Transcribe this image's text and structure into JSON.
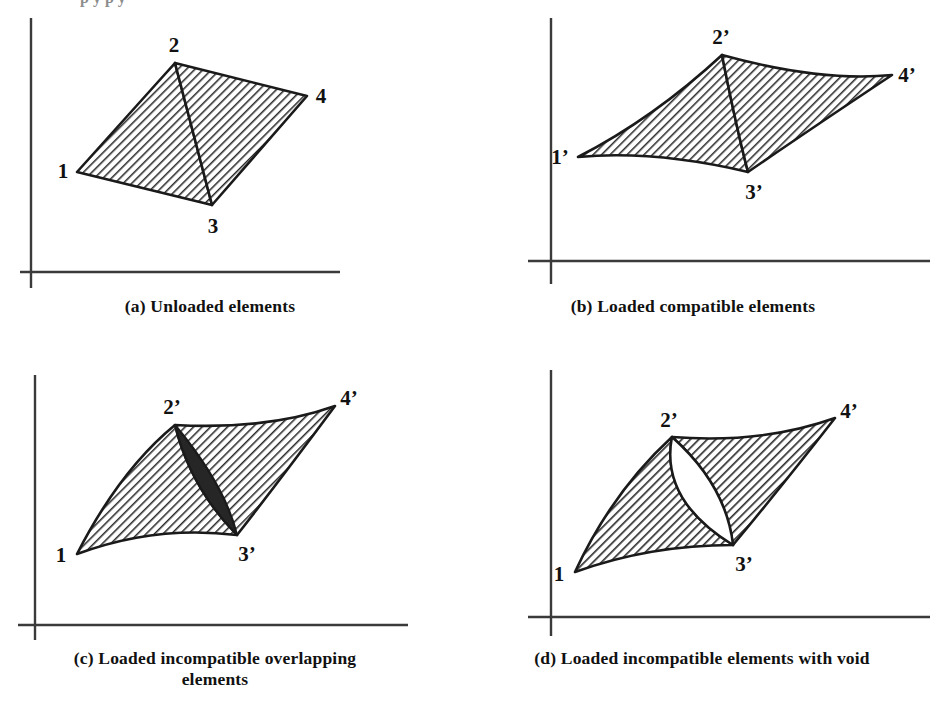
{
  "figure": {
    "background_color": "#ffffff",
    "ink_color": "#1a1a1a",
    "hatch_color": "#2b2b2b",
    "overlap_fill_color": "#262626",
    "void_fill_color": "#ffffff",
    "top_remnant_text": "p y p y"
  },
  "panels": [
    {
      "id": "a",
      "caption": "(a) Unloaded elements",
      "axes": {
        "origin_x": 31,
        "origin_y": 272,
        "x_axis_end": 340,
        "y_axis_top": 18
      },
      "node_labels": [
        "1",
        "2",
        "3",
        "4"
      ],
      "nodes": {
        "n1": {
          "label": "1",
          "x": 77,
          "y": 172,
          "label_x": 63,
          "label_y": 168
        },
        "n2": {
          "label": "2",
          "x": 175,
          "y": 63,
          "label_x": 172,
          "label_y": 44
        },
        "n3": {
          "label": "3",
          "x": 212,
          "y": 205,
          "label_x": 212,
          "label_y": 227
        },
        "n4": {
          "label": "4",
          "x": 307,
          "y": 96,
          "label_x": 319,
          "label_y": 96
        }
      },
      "edges_straight": true,
      "has_overlap": false,
      "has_void": false
    },
    {
      "id": "b",
      "caption": "(b) Loaded compatible elements",
      "axes": {
        "origin_x": 551,
        "origin_y": 261,
        "x_axis_end": 930,
        "y_axis_top": 18
      },
      "node_labels": [
        "1'",
        "2'",
        "3'",
        "4'"
      ],
      "nodes": {
        "n1": {
          "label": "1’",
          "x": 578,
          "y": 157,
          "label_x": 561,
          "label_y": 153
        },
        "n2": {
          "label": "2’",
          "x": 722,
          "y": 55,
          "label_x": 718,
          "label_y": 37
        },
        "n3": {
          "label": "3’",
          "x": 748,
          "y": 172,
          "label_x": 752,
          "label_y": 192
        },
        "n4": {
          "label": "4’",
          "x": 892,
          "y": 75,
          "label_x": 903,
          "label_y": 74
        }
      },
      "edges_straight": false,
      "has_overlap": false,
      "has_void": false
    },
    {
      "id": "c",
      "caption": "(c) Loaded incompatible overlapping\nelements",
      "axes": {
        "origin_x": 35,
        "origin_y": 625,
        "x_axis_end": 408,
        "y_axis_top": 375
      },
      "node_labels": [
        "1",
        "2'",
        "3'",
        "4'"
      ],
      "nodes": {
        "n1": {
          "label": "1",
          "x": 77,
          "y": 554,
          "label_x": 62,
          "label_y": 557
        },
        "n2": {
          "label": "2’",
          "x": 175,
          "y": 425,
          "label_x": 170,
          "label_y": 406
        },
        "n3": {
          "label": "3’",
          "x": 237,
          "y": 535,
          "label_x": 243,
          "label_y": 553
        },
        "n4": {
          "label": "4’",
          "x": 335,
          "y": 406,
          "label_x": 345,
          "label_y": 398
        }
      },
      "edges_straight": false,
      "has_overlap": true,
      "has_void": false,
      "overlap_region": "lens between nodes 2' and 3' where the two triangular elements double-cover"
    },
    {
      "id": "d",
      "caption": "(d) Loaded incompatible elements with void",
      "axes": {
        "origin_x": 551,
        "origin_y": 617,
        "x_axis_end": 930,
        "y_axis_top": 370
      },
      "node_labels": [
        "1",
        "2'",
        "3'",
        "4'"
      ],
      "nodes": {
        "n1": {
          "label": "1",
          "x": 575,
          "y": 572,
          "label_x": 560,
          "label_y": 575
        },
        "n2": {
          "label": "2’",
          "x": 672,
          "y": 437,
          "label_x": 667,
          "label_y": 419
        },
        "n3": {
          "label": "3’",
          "x": 733,
          "y": 545,
          "label_x": 738,
          "label_y": 563
        },
        "n4": {
          "label": "4’",
          "x": 835,
          "y": 418,
          "label_x": 845,
          "label_y": 412
        }
      },
      "edges_straight": false,
      "has_overlap": false,
      "has_void": true,
      "void_region": "white lens gap between nodes 2' and 3' where the two triangular elements separate"
    }
  ]
}
